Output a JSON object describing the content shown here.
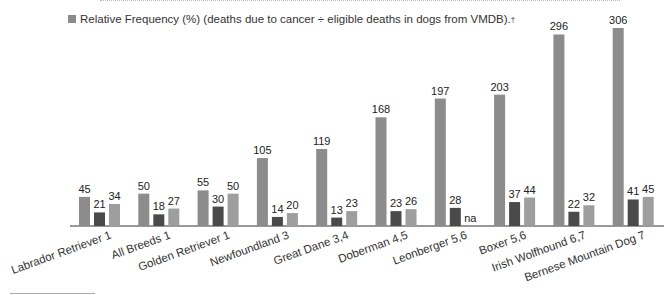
{
  "legend": {
    "label": "Relative Frequency (%) (deaths due to cancer ÷ eligible deaths in dogs from VMDB).",
    "dagger": "†",
    "swatch_color": "#8c8c8c"
  },
  "colors": {
    "series1": "#8c8c8c",
    "series2": "#4a4a4a",
    "series3": "#9e9e9e",
    "axis": "#333333"
  },
  "chart_data": {
    "type": "bar",
    "title": "",
    "xlabel": "",
    "ylabel": "",
    "ylim": [
      0,
      310
    ],
    "grid": false,
    "legend_position": "top",
    "categories": [
      "Labrador Retriever 1",
      "All Breeds 1",
      "Golden Retriever 1",
      "Newfoundland 3",
      "Great Dane 3,4",
      "Doberman 4,5",
      "Leonberger 5,6",
      "Boxer 5,6",
      "Irish Wolfhound 6,7",
      "Bernese Mountain Dog 7"
    ],
    "series": [
      {
        "name": "Relative Frequency (%) (deaths due to cancer ÷ eligible deaths in dogs from VMDB).†",
        "values": [
          45,
          50,
          55,
          105,
          119,
          168,
          197,
          203,
          296,
          306
        ],
        "labels": [
          "45",
          "50",
          "55",
          "105",
          "119",
          "168",
          "197",
          "203",
          "296",
          "306"
        ]
      },
      {
        "name": "Series 2",
        "values": [
          21,
          18,
          30,
          14,
          13,
          23,
          28,
          37,
          22,
          41
        ],
        "labels": [
          "21",
          "18",
          "30",
          "14",
          "13",
          "23",
          "28",
          "37",
          "22",
          "41"
        ]
      },
      {
        "name": "Series 3",
        "values": [
          34,
          27,
          50,
          20,
          23,
          26,
          null,
          44,
          32,
          45
        ],
        "labels": [
          "34",
          "27",
          "50",
          "20",
          "23",
          "26",
          "na",
          "44",
          "32",
          "45"
        ]
      }
    ]
  }
}
